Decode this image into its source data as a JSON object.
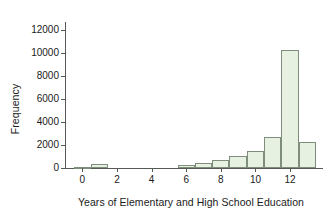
{
  "chart_data": {
    "type": "bar",
    "title": "",
    "subtitle": "",
    "xlabel": "Years of Elementary and High School Education",
    "ylabel": "Frequency",
    "xlim": [
      -1.0,
      13.9
    ],
    "ylim": [
      0,
      12700
    ],
    "xticks": [
      0,
      2,
      4,
      6,
      8,
      10,
      12
    ],
    "xtick_labels": [
      "0",
      "2",
      "4",
      "6",
      "8",
      "10",
      "12"
    ],
    "yticks": [
      0,
      2000,
      4000,
      6000,
      8000,
      10000,
      12000
    ],
    "ytick_labels": [
      "0",
      "2000",
      "4000",
      "6000",
      "8000",
      "10000",
      "12000"
    ],
    "grid": false,
    "legend": null,
    "bar_width": 1,
    "bar_fill_color": "#e7f1e1",
    "bar_edge_color": "#7f8d7c",
    "axis_color": "#555a55",
    "categories": [
      0,
      1,
      2,
      3,
      4,
      5,
      6,
      7,
      8,
      9,
      10,
      11,
      12,
      13
    ],
    "values": [
      60,
      330,
      0,
      0,
      0,
      0,
      300,
      470,
      720,
      1080,
      1480,
      2700,
      10250,
      2230
    ],
    "bars": [
      {
        "x": 0,
        "x0": -0.5,
        "x1": 0.5,
        "value": 60
      },
      {
        "x": 1,
        "x0": 0.5,
        "x1": 1.5,
        "value": 330
      },
      {
        "x": 6,
        "x0": 5.5,
        "x1": 6.5,
        "value": 300
      },
      {
        "x": 7,
        "x0": 6.5,
        "x1": 7.5,
        "value": 470
      },
      {
        "x": 8,
        "x0": 7.5,
        "x1": 8.5,
        "value": 720
      },
      {
        "x": 9,
        "x0": 8.5,
        "x1": 9.5,
        "value": 1080
      },
      {
        "x": 10,
        "x0": 9.5,
        "x1": 10.5,
        "value": 1480
      },
      {
        "x": 11,
        "x0": 10.5,
        "x1": 11.5,
        "value": 2700
      },
      {
        "x": 12,
        "x0": 11.5,
        "x1": 12.5,
        "value": 10250
      },
      {
        "x": 13,
        "x0": 12.5,
        "x1": 13.5,
        "value": 2230
      }
    ]
  }
}
